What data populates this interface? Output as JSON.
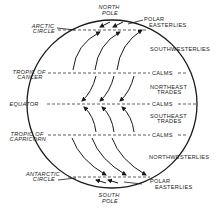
{
  "diagram": {
    "poles": {
      "north": [
        "NORTH",
        "POLE"
      ],
      "south": [
        "SOUTH",
        "POLE"
      ]
    },
    "latitudes_left": {
      "arctic": [
        "ARCTIC",
        "CIRCLE"
      ],
      "cancer": [
        "TROPIC OF",
        "CANCER"
      ],
      "equator": [
        "EQUATOR"
      ],
      "capricorn": [
        "TROPIC OF",
        "CAPRICORN"
      ],
      "antarctic": [
        "ANTARCTIC",
        "CIRCLE"
      ]
    },
    "belts_right": {
      "polar_north": [
        "POLAR",
        "EASTERLIES"
      ],
      "southwesterlies": "SOUTHWESTERLIES",
      "calms_1": "CALMS",
      "northeast_trades": [
        "NORTHEAST",
        "TRADES"
      ],
      "calms_2": "CALMS",
      "southeast_trades": [
        "SOUTHEAST",
        "TRADES"
      ],
      "calms_3": "CALMS",
      "northwesterlies": "NORTHWESTERLIES",
      "polar_south": [
        "POLAR",
        "EASTERLIES"
      ]
    },
    "colors": {
      "ink": "#1a1a1a",
      "background": "#ffffff"
    }
  }
}
